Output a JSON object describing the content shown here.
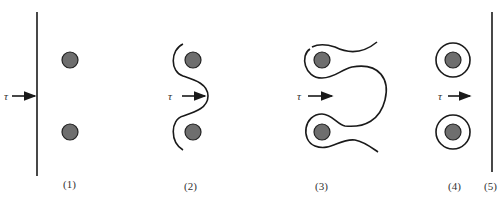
{
  "figure": {
    "corner_mark": "图",
    "colors": {
      "particle_fill": "#6e6e6e",
      "stroke": "#1a1a1a",
      "background": "#ffffff"
    },
    "stress_symbol": "τ",
    "panels": [
      {
        "id": 1,
        "label": "(1)",
        "description": "straight dislocation line approaching two particles"
      },
      {
        "id": 2,
        "label": "(2)",
        "description": "dislocation bowing between particles"
      },
      {
        "id": 3,
        "label": "(3)",
        "description": "dislocation loops wrapping particles, about to pinch off"
      },
      {
        "id": 4,
        "label": "(4)",
        "description": "Orowan loops left around particles"
      },
      {
        "id": 5,
        "label": "(5)",
        "description": "dislocation line released, moving on"
      }
    ]
  }
}
